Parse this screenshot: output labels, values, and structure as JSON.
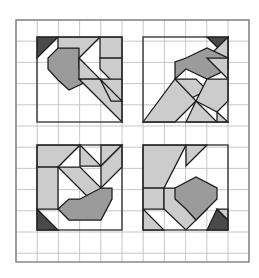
{
  "figure": {
    "canvas": {
      "width": 259,
      "height": 278,
      "background": "#ffffff"
    },
    "outer_border": {
      "name": "outer-frame",
      "x": 16,
      "y": 20,
      "width": 233,
      "height": 242,
      "stroke": "#808080",
      "stroke_width": 1.4,
      "fill": "none"
    },
    "grid": {
      "name": "background-grid",
      "x": 16,
      "y": 20,
      "width": 233,
      "height": 242,
      "cell_size": 21.2,
      "columns": 11,
      "rows": 11.4,
      "stroke": "#b9b9b9",
      "stroke_width": 0.8,
      "visible": true
    },
    "colors": {
      "dark": "#4a4a4a",
      "mid": "#9b9b9b",
      "light": "#cccccc",
      "outline": "#1a1a1a",
      "grid_line": "#b9b9b9",
      "frame": "#808080",
      "background": "#ffffff"
    },
    "panels": [
      {
        "id": "panel-top-left",
        "label": "Top-left tangram",
        "box": {
          "x": 37,
          "y": 37,
          "width": 85,
          "height": 85
        },
        "pieces": [
          {
            "name": "dark-corner-triangle",
            "tone": "dark",
            "points": "37,37 58,37 37,58"
          },
          {
            "name": "light-upper-parallelogram",
            "tone": "light",
            "points": "58,37 100,37 79,58 58,58"
          },
          {
            "name": "light-upper-right-triangle",
            "tone": "light",
            "points": "100,37 122,37 122,58 100,58"
          },
          {
            "name": "mid-bent-hexagon",
            "tone": "mid",
            "points": "58,48 79,48 79,69 90,80 69,90 58,80 48,69 48,58"
          },
          {
            "name": "light-center-triangle",
            "tone": "light",
            "points": "79,58 100,79 79,79"
          },
          {
            "name": "light-right-kite",
            "tone": "light",
            "points": "100,58 122,58 122,80 111,80 100,69"
          },
          {
            "name": "light-lower-big-triangle",
            "tone": "light",
            "points": "79,79 122,79 122,122"
          },
          {
            "name": "light-lower-small-triangle",
            "tone": "light",
            "points": "100,79 122,101 111,101"
          }
        ]
      },
      {
        "id": "panel-top-right",
        "label": "Top-right tangram",
        "box": {
          "x": 143,
          "y": 37,
          "width": 85,
          "height": 85
        },
        "pieces": [
          {
            "name": "dark-corner-triangle",
            "tone": "dark",
            "points": "207,37 228,37 228,58"
          },
          {
            "name": "light-top-right-wedge",
            "tone": "light",
            "points": "228,37 228,58 207,58"
          },
          {
            "name": "mid-bent-hexagon",
            "tone": "mid",
            "points": "186,58 207,48 228,58 228,69 207,79 186,69 175,79 175,62"
          },
          {
            "name": "light-upper-right-triangle",
            "tone": "light",
            "points": "207,58 228,58 228,79"
          },
          {
            "name": "light-center-diamond",
            "tone": "light",
            "points": "175,79 196,79 207,90 186,101 175,90"
          },
          {
            "name": "light-right-arm",
            "tone": "light",
            "points": "207,79 228,79 228,101 217,112 196,101"
          },
          {
            "name": "light-lower-left-big-triangle",
            "tone": "light",
            "points": "143,122 175,79 196,101 175,122"
          },
          {
            "name": "light-lower-right-triangle",
            "tone": "light",
            "points": "196,101 217,122 186,122"
          },
          {
            "name": "light-lower-right-small-triangle",
            "tone": "light",
            "points": "217,112 228,122 217,122"
          }
        ]
      },
      {
        "id": "panel-bottom-left",
        "label": "Bottom-left tangram",
        "box": {
          "x": 37,
          "y": 145,
          "width": 85,
          "height": 85
        },
        "pieces": [
          {
            "name": "light-top-left-block",
            "tone": "light",
            "points": "37,145 80,145 58,167 37,167"
          },
          {
            "name": "light-top-middle-triangle",
            "tone": "light",
            "points": "80,145 101,166 80,166"
          },
          {
            "name": "light-top-right-wedge",
            "tone": "light",
            "points": "101,145 122,145 101,166"
          },
          {
            "name": "light-left-column",
            "tone": "light",
            "points": "37,167 58,167 58,209 37,209"
          },
          {
            "name": "light-diagonal-band",
            "tone": "light",
            "points": "58,167 101,210 101,188 80,167"
          },
          {
            "name": "light-right-diagonal",
            "tone": "light",
            "points": "101,166 122,145 122,167 101,188"
          },
          {
            "name": "mid-bent-hexagon",
            "tone": "mid",
            "points": "80,199 101,188 112,188 112,199 101,220 69,220 58,209 69,199"
          },
          {
            "name": "dark-corner-triangle",
            "tone": "dark",
            "points": "37,209 58,230 37,230"
          }
        ]
      },
      {
        "id": "panel-bottom-right",
        "label": "Bottom-right tangram",
        "box": {
          "x": 143,
          "y": 145,
          "width": 85,
          "height": 85
        },
        "pieces": [
          {
            "name": "light-upper-left-big-triangle",
            "tone": "light",
            "points": "143,145 186,145 164,188 143,188"
          },
          {
            "name": "light-top-strip",
            "tone": "light",
            "points": "186,145 207,145 186,166"
          },
          {
            "name": "light-left-lower-triangle",
            "tone": "light",
            "points": "143,188 164,188 164,209 143,209"
          },
          {
            "name": "light-diagonal-arm",
            "tone": "light",
            "points": "164,188 186,188 207,209 186,230 164,209"
          },
          {
            "name": "mid-bent-hexagon",
            "tone": "mid",
            "points": "175,188 196,177 217,188 217,199 207,209 196,220 186,209 175,199"
          },
          {
            "name": "light-lower-left-triangle",
            "tone": "light",
            "points": "143,209 164,230 143,230"
          },
          {
            "name": "dark-corner-triangle",
            "tone": "dark",
            "points": "217,209 228,220 228,230 207,230"
          },
          {
            "name": "light-bottom-right-wedge",
            "tone": "light",
            "points": "217,209 228,209 228,220"
          }
        ]
      }
    ]
  }
}
